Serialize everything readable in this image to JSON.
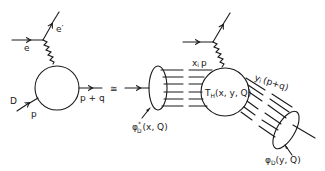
{
  "diagram": {
    "type": "feynman-diagram",
    "relation_symbol": "≅",
    "left": {
      "incoming_lepton": "e",
      "outgoing_lepton": "e′",
      "incoming_hadron": "D",
      "incoming_momentum": "p",
      "outgoing_momentum": "p + q"
    },
    "right": {
      "incoming_wavefunction": {
        "symbol": "φ",
        "superscript": "*",
        "subscript": "D",
        "args": "(x, Q)"
      },
      "constituent_momentum": {
        "var": "x",
        "sub": "i",
        "rest": "p"
      },
      "hard_scattering": {
        "symbol": "T",
        "subscript": "H",
        "args": "(x, y, Q)"
      },
      "outgoing_constituent_momentum": {
        "var": "y",
        "sub": "i",
        "rest": "(p+q)"
      },
      "outgoing_wavefunction": {
        "symbol": "φ",
        "subscript": "D",
        "args": "(y, Q)"
      }
    }
  }
}
